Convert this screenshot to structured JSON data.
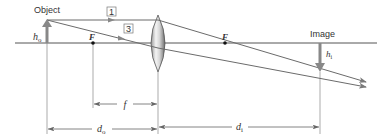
{
  "diagram": {
    "labels": {
      "object": "Object",
      "image": "Image",
      "focal_left": "F",
      "focal_right": "F",
      "object_height": "h",
      "object_height_sub": "o",
      "image_height": "h",
      "image_height_sub": "i",
      "focal_length": "f",
      "object_distance": "d",
      "object_distance_sub": "o",
      "image_distance": "d",
      "image_distance_sub": "i"
    },
    "ray_labels": [
      "1",
      "3"
    ],
    "colors": {
      "line": "#6b6b6b",
      "arrow": "#7a7a7a",
      "text": "#333333"
    }
  }
}
